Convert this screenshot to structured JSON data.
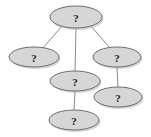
{
  "diagram": {
    "type": "graph",
    "title": "",
    "background_color": "#ffffff",
    "node_fill_color": "#d6d6d6",
    "node_stroke_color": "#6e6e6e",
    "node_shadow_color": "#b5b5b5",
    "edge_color": "#8a8a8a",
    "label_color": "#1a1a1a",
    "nodes": [
      {
        "id": "n1",
        "label": "?",
        "cx": 76,
        "cy": 17,
        "rx": 26,
        "ry": 11
      },
      {
        "id": "n2",
        "label": "?",
        "cx": 34,
        "cy": 57,
        "rx": 25,
        "ry": 10
      },
      {
        "id": "n3",
        "label": "?",
        "cx": 117,
        "cy": 57,
        "rx": 24,
        "ry": 10
      },
      {
        "id": "n4",
        "label": "?",
        "cx": 75,
        "cy": 81,
        "rx": 25,
        "ry": 10
      },
      {
        "id": "n5",
        "label": "?",
        "cx": 118,
        "cy": 97,
        "rx": 24,
        "ry": 10
      },
      {
        "id": "n6",
        "label": "?",
        "cx": 74,
        "cy": 120,
        "rx": 25,
        "ry": 10
      }
    ],
    "edges": [
      {
        "from": "n1",
        "to": "n2",
        "x1": 62,
        "y1": 26,
        "x2": 43,
        "y2": 48
      },
      {
        "from": "n1",
        "to": "n4",
        "x1": 76,
        "y1": 28,
        "x2": 75,
        "y2": 71
      },
      {
        "from": "n1",
        "to": "n3",
        "x1": 91,
        "y1": 26,
        "x2": 110,
        "y2": 48
      },
      {
        "from": "n3",
        "to": "n5",
        "x1": 117,
        "y1": 67,
        "x2": 118,
        "y2": 87
      },
      {
        "from": "n4",
        "to": "n6",
        "x1": 75,
        "y1": 91,
        "x2": 74,
        "y2": 110
      }
    ]
  }
}
